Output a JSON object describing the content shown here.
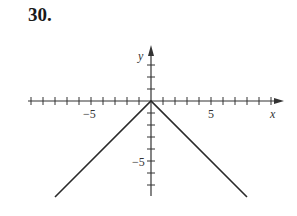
{
  "problem": {
    "number": "30."
  },
  "chart_data": {
    "type": "line",
    "title": "",
    "xlabel": "x",
    "ylabel": "y",
    "xlim": [
      -10,
      11
    ],
    "ylim": [
      -8,
      4
    ],
    "x_tick_labels": [
      "-5",
      "5"
    ],
    "y_tick_labels": [
      "-5"
    ],
    "x_tick_labels_display": [
      "−5",
      "5"
    ],
    "y_tick_labels_display": [
      "−5"
    ],
    "grid": false,
    "series": [
      {
        "name": "y = -|x|",
        "x": [
          -8,
          0,
          8
        ],
        "y": [
          -8,
          0,
          -8
        ]
      }
    ]
  },
  "colors": {
    "axis": "#333333",
    "line": "#2a2a2a"
  }
}
